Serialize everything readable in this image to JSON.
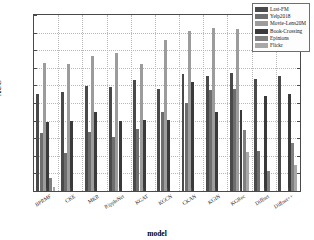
{
  "chart_data": {
    "type": "bar",
    "title": "",
    "xlabel": "model",
    "ylabel": "AUC",
    "ylim": [
      0.5,
      1.0
    ],
    "yticks": [
      "0.5",
      "0.55",
      "0.6",
      "0.65",
      "0.7",
      "0.75",
      "0.8",
      "0.85",
      "0.9",
      "0.95",
      "1"
    ],
    "grid": true,
    "legend_position": "top-right",
    "categories": [
      "BPRMF",
      "CKE",
      "MKR",
      "RippleNet",
      "KGAT",
      "KGCN",
      "CKAN",
      "KGIN",
      "KGRec",
      "Diffnet",
      "Diffnet++"
    ],
    "series": [
      {
        "name": "Last-FM",
        "color": "#4a4a4a",
        "values": [
          0.776,
          0.78,
          0.799,
          0.795,
          0.815,
          0.791,
          0.833,
          0.827,
          0.835,
          0.818,
          0.827
        ]
      },
      {
        "name": "Yelp2018",
        "color": "#6e6e6e",
        "values": [
          0.665,
          0.608,
          0.668,
          0.654,
          0.675,
          0.725,
          0.75,
          0.787,
          0.789,
          0.615,
          null
        ]
      },
      {
        "name": "Movie-Lens20M",
        "color": "#9c9c9c",
        "values": [
          0.863,
          0.861,
          0.884,
          0.892,
          0.861,
          0.93,
          0.956,
          0.962,
          0.96,
          null,
          null
        ]
      },
      {
        "name": "Book-Crossing",
        "color": "#3a3a3a",
        "values": [
          0.695,
          0.698,
          0.724,
          0.7,
          0.701,
          0.703,
          0.81,
          0.724,
          0.729,
          0.77,
          0.775
        ]
      },
      {
        "name": "Epinions",
        "color": "#808080",
        "values": [
          0.537,
          null,
          null,
          null,
          null,
          null,
          null,
          null,
          0.673,
          0.557,
          0.635
        ]
      },
      {
        "name": "Flickr",
        "color": "#a8a8a8",
        "values": [
          0.512,
          null,
          null,
          null,
          null,
          null,
          null,
          null,
          0.61,
          null,
          0.573
        ]
      }
    ]
  },
  "legend": {
    "entries": [
      "Last-FM",
      "Yelp2018",
      "Movie-Lens20M",
      "Book-Crossing",
      "Epinions",
      "Flickr"
    ]
  },
  "axes": {
    "y_axis_title": "AUC",
    "x_axis_title": "model"
  }
}
